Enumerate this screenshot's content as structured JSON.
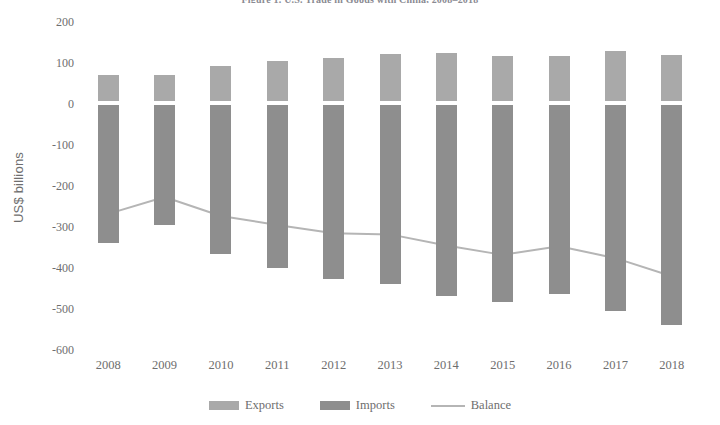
{
  "chart_data": {
    "type": "bar",
    "title": "Figure 1. U.S. Trade in Goods with China, 2008–2018",
    "xlabel": "",
    "ylabel": "US$ billions",
    "categories": [
      "2008",
      "2009",
      "2010",
      "2011",
      "2012",
      "2013",
      "2014",
      "2015",
      "2016",
      "2017",
      "2018"
    ],
    "ylim": [
      -600,
      200
    ],
    "yticks": [
      200,
      100,
      0,
      -100,
      -200,
      -300,
      -400,
      -500,
      -600
    ],
    "ytick_labels": [
      "200",
      "100",
      "0",
      "-100",
      "-200",
      "-300",
      "-400",
      "-500",
      "-600"
    ],
    "grid": false,
    "legend_position": "bottom",
    "series": [
      {
        "name": "Exports",
        "type": "bar",
        "color": "#a9a9a9",
        "values": [
          70,
          70,
          92,
          104,
          111,
          122,
          124,
          116,
          116,
          130,
          120
        ]
      },
      {
        "name": "Imports",
        "type": "bar",
        "color": "#8e8e8e",
        "values": [
          -338,
          -296,
          -365,
          -399,
          -426,
          -440,
          -469,
          -484,
          -463,
          -506,
          -540
        ]
      },
      {
        "name": "Balance",
        "type": "line",
        "color": "#b5b5b5",
        "values": [
          -268,
          -227,
          -273,
          -295,
          -315,
          -318,
          -345,
          -368,
          -347,
          -376,
          -420
        ]
      }
    ]
  },
  "axis": {
    "y_title": "US$ billions"
  },
  "legend": {
    "items": [
      {
        "label": "Exports",
        "marker": "swatch",
        "color": "#a9a9a9"
      },
      {
        "label": "Imports",
        "marker": "swatch",
        "color": "#8e8e8e"
      },
      {
        "label": "Balance",
        "marker": "line",
        "color": "#b5b5b5"
      }
    ]
  }
}
